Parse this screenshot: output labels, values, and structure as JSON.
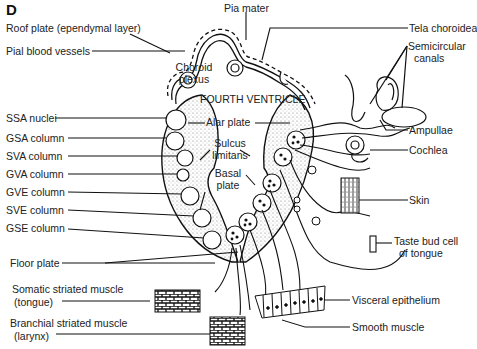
{
  "panel_letter": "D",
  "center_label": "FOURTH VENTRICLE",
  "left_labels": {
    "roof_plate": "Roof plate (ependymal layer)",
    "pial_vessels": "Pial blood vessels",
    "ssa": "SSA nuclei",
    "gsa": "GSA column",
    "sva": "SVA column",
    "gva": "GVA column",
    "gve": "GVE column",
    "sve": "SVE column",
    "gse": "GSE column",
    "floor_plate": "Floor plate",
    "somatic_muscle_1": "Somatic striated muscle",
    "somatic_muscle_2": "(tongue)",
    "branchial_muscle_1": "Branchial striated muscle",
    "branchial_muscle_2": "(larynx)"
  },
  "inner_labels": {
    "choroid_1": "Choroid",
    "choroid_2": "plexus",
    "alar": "Alar plate",
    "sulcus_1": "Sulcus",
    "sulcus_2": "limitans",
    "basal_1": "Basal",
    "basal_2": "plate",
    "pia": "Pia mater"
  },
  "right_labels": {
    "tela": "Tela choroidea",
    "semicircular_1": "Semicircular",
    "semicircular_2": "canals",
    "ampullae": "Ampullae",
    "cochlea": "Cochlea",
    "skin": "Skin",
    "taste_1": "Taste bud cell",
    "taste_2": "of tongue",
    "visceral": "Visceral epithelium",
    "smooth": "Smooth muscle"
  }
}
